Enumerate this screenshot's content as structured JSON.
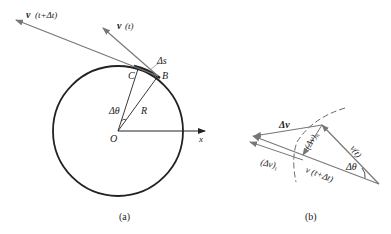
{
  "figure_a": {
    "caption": "(a)",
    "labels": {
      "v_t_dt": "v",
      "v_t_dt_arg": "(t+Δt)",
      "v_t": "v",
      "v_t_arg": "(t)",
      "delta_s": "Δs",
      "point_c": "C",
      "point_b": "B",
      "delta_theta": "Δθ",
      "radius": "R",
      "origin": "O",
      "x_axis": "x"
    }
  },
  "figure_b": {
    "caption": "(b)",
    "labels": {
      "delta_v": "Δv",
      "delta_v_n": "(Δv)",
      "delta_v_n_sub": "n",
      "delta_v_t": "(Δv)",
      "delta_v_t_sub": "t",
      "v_t": "v(t)",
      "v_t_dt": "v (t+Δt)",
      "delta_theta": "Δθ"
    }
  },
  "colors": {
    "line": "#222222",
    "vector": "#777777"
  }
}
